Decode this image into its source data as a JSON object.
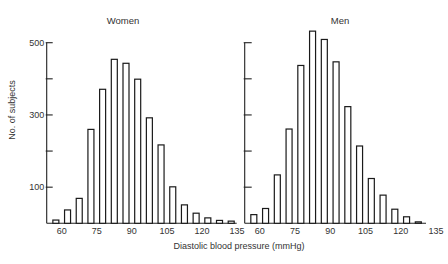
{
  "figure": {
    "ylabel": "No. of subjects",
    "xlabel": "Diastolic blood pressure (mmHg)"
  },
  "chart_data": [
    {
      "type": "bar",
      "title": "Women",
      "xlabel": "Diastolic blood pressure (mmHg)",
      "ylabel": "No. of subjects",
      "categories": [
        "55-60",
        "60-65",
        "65-70",
        "70-75",
        "75-80",
        "80-85",
        "85-90",
        "90-95",
        "95-100",
        "100-105",
        "105-110",
        "110-115",
        "115-120",
        "120-125",
        "125-130",
        "130-135"
      ],
      "bin_centers": [
        57.5,
        62.5,
        67.5,
        72.5,
        77.5,
        82.5,
        87.5,
        92.5,
        97.5,
        102.5,
        107.5,
        112.5,
        117.5,
        122.5,
        127.5,
        132.5
      ],
      "values": [
        9,
        37,
        69,
        260,
        371,
        454,
        443,
        399,
        292,
        217,
        101,
        51,
        28,
        15,
        8,
        6
      ],
      "ylim": [
        0,
        500
      ],
      "yticks": [
        100,
        200,
        300,
        400,
        500
      ],
      "ytick_labels": {
        "100": "100",
        "300": "300",
        "500": "500"
      },
      "xticks": [
        60,
        75,
        90,
        105,
        120,
        135
      ],
      "xtick_labels": [
        "60",
        "75",
        "90",
        "105",
        "120",
        "135"
      ],
      "grid": false,
      "legend": "none"
    },
    {
      "type": "bar",
      "title": "Men",
      "xlabel": "Diastolic blood pressure (mmHg)",
      "ylabel": "No. of subjects",
      "categories": [
        "55-60",
        "60-65",
        "65-70",
        "70-75",
        "75-80",
        "80-85",
        "85-90",
        "90-95",
        "95-100",
        "100-105",
        "105-110",
        "110-115",
        "115-120",
        "120-125",
        "125-130"
      ],
      "bin_centers": [
        57.5,
        62.5,
        67.5,
        72.5,
        77.5,
        82.5,
        87.5,
        92.5,
        97.5,
        102.5,
        107.5,
        112.5,
        117.5,
        122.5,
        127.5
      ],
      "values": [
        24,
        41,
        134,
        261,
        437,
        532,
        509,
        447,
        323,
        214,
        124,
        78,
        39,
        18,
        4
      ],
      "ylim": [
        0,
        500
      ],
      "yticks": [
        100,
        200,
        300,
        400,
        500
      ],
      "ytick_labels": {},
      "xticks": [
        60,
        75,
        90,
        105,
        120,
        135
      ],
      "xtick_labels": [
        "60",
        "75",
        "90",
        "105",
        "120",
        "135"
      ],
      "grid": false,
      "legend": "none"
    }
  ]
}
